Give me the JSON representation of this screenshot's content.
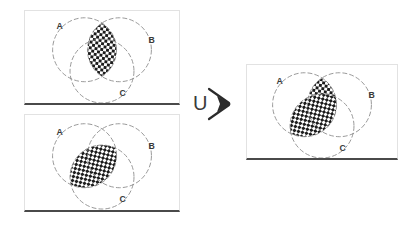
{
  "figure": {
    "operator_symbol": "U",
    "arrow_symbol": "arrow-right",
    "set_labels": [
      "A",
      "B",
      "C"
    ],
    "stroke_color": "#8a8a8a",
    "shade_fill_dark": "#1c1c1c",
    "shade_fill_light": "#ffffff",
    "label_color": "#3a3a3a",
    "panel_border_color": "#e2e2e2",
    "panel_baseline_color": "#4a4a4a"
  },
  "panels": [
    {
      "id": "operand-1",
      "name": "first-operand-panel",
      "shaded_region": "A intersect B",
      "labels": {
        "a": "A",
        "b": "B",
        "c": "C"
      }
    },
    {
      "id": "operand-2",
      "name": "second-operand-panel",
      "shaded_region": "A intersect C",
      "labels": {
        "a": "A",
        "b": "B",
        "c": "C"
      }
    },
    {
      "id": "result",
      "name": "result-panel",
      "shaded_region": "(A intersect B) union (A intersect C)",
      "labels": {
        "a": "A",
        "b": "B",
        "c": "C"
      }
    }
  ],
  "operator": {
    "union_label": "U",
    "arrow_label": "→"
  }
}
